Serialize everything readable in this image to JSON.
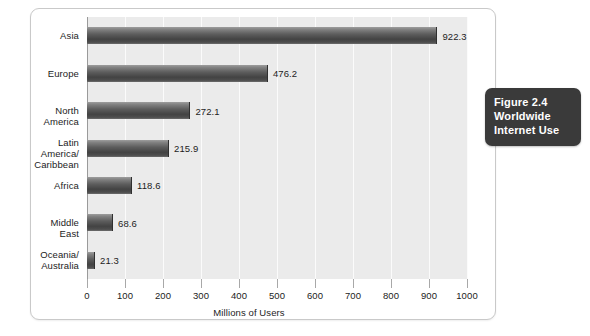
{
  "figure": {
    "caption_line1": "Figure 2.4",
    "caption_line2": "Worldwide",
    "caption_line3": "Internet Use"
  },
  "chart_data": {
    "type": "bar",
    "orientation": "horizontal",
    "title": "Worldwide Internet Use",
    "xlabel": "Millions of Users",
    "ylabel": "",
    "xlim": [
      0,
      1000
    ],
    "xticks": [
      0,
      100,
      200,
      300,
      400,
      500,
      600,
      700,
      800,
      900,
      1000
    ],
    "xtick_labels": [
      "0",
      "100",
      "200",
      "300",
      "400",
      "500",
      "600",
      "700",
      "800",
      "900",
      "1000"
    ],
    "grid": true,
    "legend": false,
    "categories": [
      "Asia",
      "Europe",
      "North America",
      "Latin America/\nCaribbean",
      "Africa",
      "Middle East",
      "Oceania/\nAustralia"
    ],
    "category_lines": [
      [
        "Asia"
      ],
      [
        "Europe"
      ],
      [
        "North America"
      ],
      [
        "Latin America/",
        "Caribbean"
      ],
      [
        "Africa"
      ],
      [
        "Middle East"
      ],
      [
        "Oceania/",
        "Australia"
      ]
    ],
    "values": [
      922.3,
      476.2,
      272.1,
      215.9,
      118.6,
      68.6,
      21.3
    ],
    "value_labels": [
      "922.3",
      "476.2",
      "272.1",
      "215.9",
      "118.6",
      "68.6",
      "21.3"
    ],
    "bar_color": "#4e4e4e",
    "plot_background": "#ebebeb",
    "gridline_color": "#fbfbfb",
    "axis_color": "#9a9a9a"
  }
}
